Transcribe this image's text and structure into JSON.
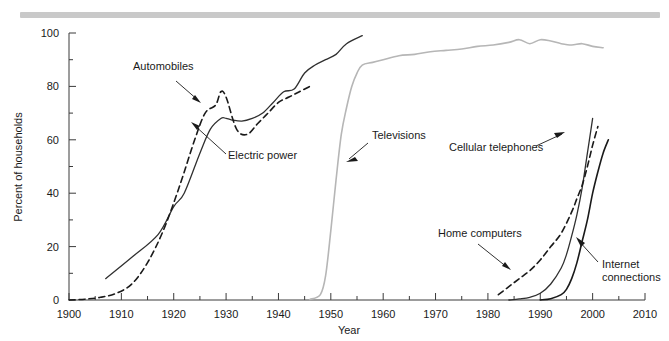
{
  "figure": {
    "top_rule_color": "#c9c9c9",
    "background": "#ffffff"
  },
  "chart_data": {
    "type": "line",
    "title": "",
    "subtitle": "",
    "xlabel": "Year",
    "ylabel": "Percent of households",
    "xlim": [
      1900,
      2010
    ],
    "ylim": [
      0,
      100
    ],
    "grid": false,
    "legend_position": "inline-annotations",
    "x_ticks": [
      1900,
      1910,
      1920,
      1930,
      1940,
      1950,
      1960,
      1970,
      1980,
      1990,
      2000,
      2010
    ],
    "x_tick_labels": [
      "1900",
      "1910",
      "1920",
      "1930",
      "1940",
      "1950",
      "1960",
      "1970",
      "1980",
      "1990",
      "2000",
      "2010"
    ],
    "x_minor_step": 5,
    "y_ticks": [
      0,
      20,
      40,
      60,
      80,
      100
    ],
    "y_tick_labels": [
      "0",
      "20",
      "40",
      "60",
      "80",
      "100"
    ],
    "y_minor_step": 10,
    "series": [
      {
        "name": "Electric power",
        "color": "#303030",
        "style": "solid",
        "width": 1.3,
        "label": "Electric power",
        "label_color": "#4a4a4a",
        "x": [
          1907,
          1912,
          1917,
          1920,
          1922,
          1925,
          1927,
          1929,
          1930,
          1931,
          1933,
          1935,
          1937,
          1939,
          1941,
          1943,
          1945,
          1947,
          1949,
          1951,
          1953,
          1956
        ],
        "y": [
          8,
          16,
          24.5,
          35,
          40,
          55,
          64,
          68,
          68,
          67.5,
          67,
          68,
          70,
          74,
          78,
          79,
          85,
          88,
          90,
          92,
          96,
          99
        ]
      },
      {
        "name": "Automobiles",
        "color": "#1a1a1a",
        "style": "dashed",
        "width": 1.6,
        "label": "Automobiles",
        "label_color": "#1a1a1a",
        "x": [
          1900,
          1903,
          1906,
          1909,
          1912,
          1915,
          1918,
          1921,
          1924,
          1926,
          1928,
          1929,
          1930,
          1932,
          1934,
          1936,
          1938,
          1940,
          1942,
          1944,
          1946
        ],
        "y": [
          0,
          0.3,
          1,
          2.5,
          6,
          14,
          26,
          42,
          60,
          70,
          73,
          78,
          76,
          64,
          62,
          66,
          70,
          74,
          76,
          78,
          80
        ]
      },
      {
        "name": "Televisions",
        "color": "#b6b6b6",
        "style": "solid",
        "width": 1.6,
        "label": "Televisions",
        "label_color": "#b6b6b6",
        "x": [
          1946,
          1948,
          1949,
          1950,
          1951,
          1952,
          1953,
          1954,
          1955,
          1956,
          1958,
          1960,
          1963,
          1966,
          1969,
          1972,
          1975,
          1978,
          1981,
          1984,
          1986,
          1988,
          1990,
          1992,
          1994,
          1996,
          1998,
          2000,
          2002
        ],
        "y": [
          0.2,
          2,
          9,
          26,
          45,
          62,
          72,
          80,
          85,
          88,
          89,
          90,
          91.5,
          92,
          93,
          93.5,
          94,
          95,
          95.5,
          96.5,
          97.5,
          96,
          97.5,
          97,
          96,
          95.5,
          96,
          95,
          94.5
        ]
      },
      {
        "name": "Cellular telephones",
        "color": "#303030",
        "style": "solid",
        "width": 1.3,
        "label": "Cellular telephones",
        "label_color": "#4a4a4a",
        "x": [
          1984,
          1986,
          1988,
          1990,
          1992,
          1994,
          1995,
          1996,
          1997,
          1998,
          1999,
          2000
        ],
        "y": [
          0,
          0.4,
          1,
          2.5,
          6,
          12,
          17,
          24,
          32,
          42,
          55,
          68
        ]
      },
      {
        "name": "Home computers",
        "color": "#1a1a1a",
        "style": "dashed",
        "width": 1.6,
        "label": "Home computers",
        "label_color": "#1a1a1a",
        "x": [
          1982,
          1984,
          1986,
          1988,
          1990,
          1992,
          1994,
          1996,
          1997,
          1998,
          1999,
          2000,
          2001
        ],
        "y": [
          2,
          5,
          8,
          11,
          15,
          20,
          25,
          33,
          38,
          43,
          50,
          58,
          65
        ]
      },
      {
        "name": "Internet connections",
        "color": "#1a1a1a",
        "style": "solid",
        "width": 1.6,
        "label": "Internet connections",
        "label_color": "#1a1a1a",
        "x": [
          1990,
          1992,
          1994,
          1995,
          1996,
          1997,
          1998,
          1999,
          2000,
          2001,
          2002,
          2003
        ],
        "y": [
          0,
          0.5,
          2,
          4,
          8,
          14,
          22,
          30,
          40,
          48,
          55,
          60
        ]
      }
    ],
    "annotations": [
      {
        "text": "Automobiles",
        "x_px": 133,
        "y_px": 70,
        "anchor": "start",
        "color": "#1a1a1a"
      },
      {
        "text": "Electric power",
        "x_px": 228,
        "y_px": 159,
        "anchor": "start",
        "color": "#4a4a4a"
      },
      {
        "text": "Televisions",
        "x_px": 372,
        "y_px": 139,
        "anchor": "start",
        "color": "#b6b6b6"
      },
      {
        "text": "Cellular telephones",
        "x_px": 449,
        "y_px": 151,
        "anchor": "start",
        "color": "#4a4a4a"
      },
      {
        "text": "Home computers",
        "x_px": 438,
        "y_px": 237,
        "anchor": "start",
        "color": "#1a1a1a"
      },
      {
        "text": "Internet connections",
        "x_px": 602,
        "y_px": 268,
        "anchor": "start",
        "color": "#1a1a1a"
      }
    ]
  }
}
